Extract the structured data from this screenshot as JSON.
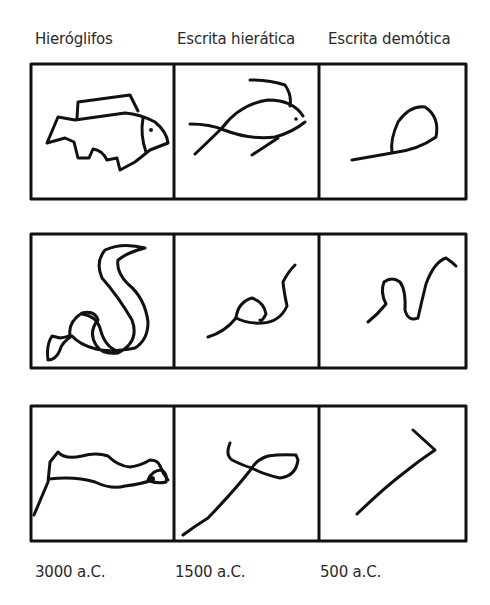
{
  "columns": [
    {
      "label": "Hieróglifos",
      "date": "3000 a.C."
    },
    {
      "label": "Escrita hierática",
      "date": "1500 a.C."
    },
    {
      "label": "Escrita demótica",
      "date": "500 a.C."
    }
  ],
  "rows": [
    {
      "name": "fish",
      "cells": [
        "hieroglyph-fish-icon",
        "hieratic-fish-icon",
        "demotic-fish-icon"
      ]
    },
    {
      "name": "snake",
      "cells": [
        "hieroglyph-snake-icon",
        "hieratic-snake-icon",
        "demotic-snake-icon"
      ]
    },
    {
      "name": "arm",
      "cells": [
        "hieroglyph-arm-icon",
        "hieratic-arm-icon",
        "demotic-arm-icon"
      ]
    }
  ],
  "colors": {
    "ink": "#111111",
    "text": "#2a2a2a",
    "background": "#ffffff"
  }
}
